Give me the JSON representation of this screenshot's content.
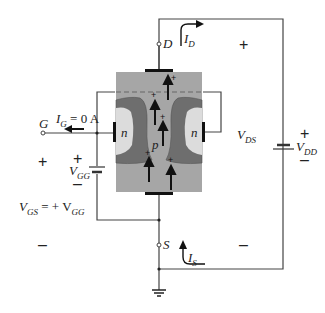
{
  "diagram": {
    "colors": {
      "substrate": "#a6a6a6",
      "depletion": "#6e6e6e",
      "n_region": "#dcdcdc",
      "wire": "#444444",
      "contact": "#111111"
    },
    "terminals": {
      "drain": "D",
      "gate": "G",
      "source": "S"
    },
    "regions": {
      "left_gate": "n",
      "right_gate": "n",
      "channel": "p"
    },
    "labels": {
      "id": "I",
      "id_sub": "D",
      "is": "I",
      "is_sub": "S",
      "ig": "I",
      "ig_sub": "G",
      "ig_value": " = 0 A",
      "vds": "V",
      "vds_sub": "DS",
      "vdd": "V",
      "vdd_sub": "DD",
      "vgg": "V",
      "vgg_sub": "GG",
      "vgs_eq_v": "V",
      "vgs_eq_sub": "GS",
      "vgs_eq_rest": " = + V",
      "vgs_eq_rest_sub": "GG"
    },
    "signs": {
      "plus": "+",
      "minus": "–"
    },
    "carriers": "+"
  }
}
